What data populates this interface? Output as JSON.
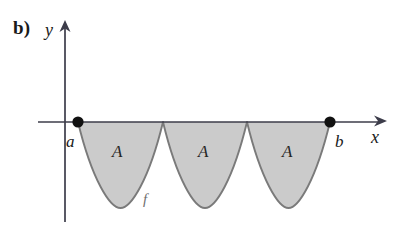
{
  "figure": {
    "part_label": "b)",
    "background_color": "#ffffff",
    "axes": {
      "y_axis_label": "y",
      "x_axis_label": "x",
      "axis_color": "#3c3c4a",
      "origin_x": 65,
      "baseline_y": 122,
      "x_axis_start": 38,
      "x_axis_end": 385,
      "y_axis_top": 22,
      "y_axis_bottom": 222
    },
    "endpoints": [
      {
        "name": "a",
        "label": "a",
        "x": 78,
        "y": 122,
        "marker": "filled-dot"
      },
      {
        "name": "b",
        "label": "b",
        "x": 330,
        "y": 122,
        "marker": "filled-dot"
      }
    ],
    "curve": {
      "function_label": "f",
      "fill_color": "#cbcbcb",
      "stroke_color": "#7a7a7a",
      "lobe_count": 3,
      "lobe_depth": 86,
      "lobes": [
        {
          "x_start": 78,
          "x_end": 163,
          "min_y": 208,
          "area_label": "A"
        },
        {
          "x_start": 163,
          "x_end": 247,
          "min_y": 208,
          "area_label": "A"
        },
        {
          "x_start": 247,
          "x_end": 330,
          "min_y": 208,
          "area_label": "A"
        }
      ]
    },
    "area_labels": [
      "A",
      "A",
      "A"
    ]
  }
}
